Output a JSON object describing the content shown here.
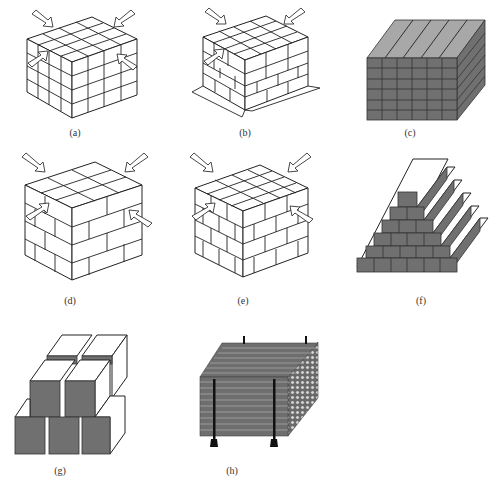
{
  "figure": {
    "panels": [
      {
        "id": "a",
        "label": "(a)",
        "description": "Cube of stacked blocks aligned in columns, with four compression arrows"
      },
      {
        "id": "b",
        "label": "(b)",
        "description": "Cube of blocks with staggered joints on lower courses, dimension arrows along base edges, three compression arrows"
      },
      {
        "id": "c",
        "label": "(c)",
        "description": "Stack of dark prismatic bars with slanted top strips"
      },
      {
        "id": "d",
        "label": "(d)",
        "description": "Brick-bond cube with large staggered blocks and four compression arrows"
      },
      {
        "id": "e",
        "label": "(e)",
        "description": "Brick-bond cube with smaller staggered blocks and four compression arrows"
      },
      {
        "id": "f",
        "label": "(f)",
        "description": "Stepped pyramid of dark bricks with white step treads"
      },
      {
        "id": "g",
        "label": "(g)",
        "description": "Stacked cubes with dark front faces and white top/side faces"
      },
      {
        "id": "h",
        "label": "(h)",
        "description": "Bundle of long horizontal tubes with circular ends, held by vertical supports"
      }
    ]
  },
  "colors": {
    "line": "#222222",
    "dark_fill": "#707070",
    "light_fill": "#a8a8a8",
    "background": "#ffffff"
  }
}
